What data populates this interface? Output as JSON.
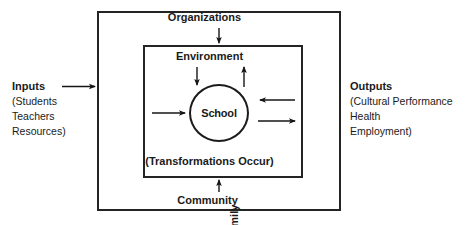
{
  "diagram": {
    "title_present": false,
    "colors": {
      "background": "#ffffff",
      "stroke": "#242424",
      "circle_stroke": "#1b1b1b",
      "text": "#1a1a1a"
    },
    "outer_box_labels": {
      "top": "Organizations",
      "bottom": "Community",
      "left_vertical": "Family",
      "right_vertical": "Individual"
    },
    "inner_box_labels": {
      "top": "Environment",
      "bottom": "(Transformations Occur)"
    },
    "center_node": {
      "label": "School",
      "shape": "circle"
    },
    "left_side": {
      "title": "Inputs",
      "lines": [
        "(Students",
        "Teachers",
        "Resources)"
      ]
    },
    "right_side": {
      "title": "Outputs",
      "lines": [
        "(Cultural Performance",
        "Health",
        "Employment)"
      ]
    },
    "arrows": [
      {
        "name": "inputs-arrow",
        "direction": "right",
        "from": "Inputs",
        "to": "outer-box"
      },
      {
        "name": "organizations-arrow",
        "direction": "down",
        "from": "Organizations",
        "to": "inner-box"
      },
      {
        "name": "community-arrow",
        "direction": "up",
        "from": "Community",
        "to": "inner-box"
      },
      {
        "name": "environment-in-arrow",
        "direction": "down",
        "from": "Environment",
        "to": "School"
      },
      {
        "name": "environment-out-arrow",
        "direction": "up",
        "from": "School",
        "to": "Environment"
      },
      {
        "name": "family-to-school-arrow",
        "direction": "right",
        "from": "Family",
        "to": "School"
      },
      {
        "name": "individual-to-school-arrow",
        "direction": "left",
        "from": "Individual",
        "to": "School"
      },
      {
        "name": "school-to-individual-arrow",
        "direction": "right",
        "from": "School",
        "to": "Individual"
      }
    ]
  }
}
